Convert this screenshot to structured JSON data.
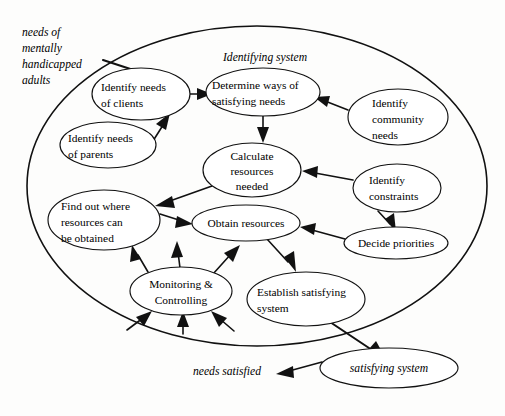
{
  "diagram": {
    "title": "Identifying system",
    "type": "influence-diagram",
    "boundary": {
      "label": "Identifying system",
      "label_x": 265,
      "label_y": 58,
      "cx": 257,
      "cy": 186,
      "rx": 230,
      "ry": 160
    },
    "external_inputs": [
      {
        "name": "needs-of-mentally-handicapped-adults",
        "lines": [
          "needs of",
          "mentally",
          "handicapped",
          "adults"
        ],
        "x": 22,
        "y": 34,
        "line_height": 16
      }
    ],
    "external_outputs": [
      {
        "name": "needs-satisfied",
        "label": "needs satisfied",
        "x": 193,
        "y": 373
      }
    ],
    "nodes": [
      {
        "id": "identify-needs-of-clients",
        "lines": [
          "Identify needs",
          "of clients"
        ],
        "cx": 141,
        "cy": 94,
        "rx": 49,
        "ry": 26,
        "align": "left",
        "text_x": 101
      },
      {
        "id": "determine-ways-of-satisfying-needs",
        "lines": [
          "Determine ways of",
          "satisfying needs"
        ],
        "cx": 263,
        "cy": 92,
        "rx": 57,
        "ry": 24,
        "align": "left",
        "text_x": 213
      },
      {
        "id": "identify-community-needs",
        "lines": [
          "Identify",
          "community",
          "needs"
        ],
        "cx": 398,
        "cy": 117,
        "rx": 50,
        "ry": 28,
        "align": "left",
        "text_x": 373
      },
      {
        "id": "identify-needs-of-parents",
        "lines": [
          "Identify needs",
          "of parents"
        ],
        "cx": 108,
        "cy": 145,
        "rx": 48,
        "ry": 23,
        "align": "left",
        "text_x": 68
      },
      {
        "id": "calculate-resources-needed",
        "lines": [
          "Calculate",
          "resources",
          "needed"
        ],
        "cx": 252,
        "cy": 170,
        "rx": 49,
        "ry": 27,
        "align": "center",
        "text_x": 252
      },
      {
        "id": "identify-constraints",
        "lines": [
          "Identify",
          "constraints"
        ],
        "cx": 397,
        "cy": 188,
        "rx": 44,
        "ry": 24,
        "align": "left",
        "text_x": 369
      },
      {
        "id": "find-out-where-resources-can-be-obtained",
        "lines": [
          "Find out where",
          "resources can",
          "be obtained"
        ],
        "cx": 104,
        "cy": 220,
        "rx": 56,
        "ry": 30,
        "align": "left",
        "text_x": 61
      },
      {
        "id": "obtain-resources",
        "lines": [
          "Obtain resources"
        ],
        "cx": 246,
        "cy": 223,
        "rx": 54,
        "ry": 18,
        "align": "center",
        "text_x": 246
      },
      {
        "id": "decide-priorities",
        "lines": [
          "Decide priorities"
        ],
        "cx": 396,
        "cy": 243,
        "rx": 52,
        "ry": 16,
        "align": "center",
        "text_x": 396
      },
      {
        "id": "monitoring-and-controlling",
        "lines": [
          "Monitoring &",
          "Controlling"
        ],
        "cx": 181,
        "cy": 291,
        "rx": 51,
        "ry": 24,
        "align": "center",
        "text_x": 181
      },
      {
        "id": "establish-satisfying-system",
        "lines": [
          "Establish satisfying",
          "system"
        ],
        "cx": 306,
        "cy": 299,
        "rx": 59,
        "ry": 27,
        "align": "left",
        "text_x": 257
      },
      {
        "id": "satisfying-system",
        "lines": [
          "satisfying system"
        ],
        "cx": 389,
        "cy": 368,
        "rx": 69,
        "ry": 20,
        "align": "center",
        "italic": true,
        "text_x": 389
      }
    ],
    "edges": [
      {
        "from": "needs-of-mentally-handicapped-adults",
        "to": "identifying-system-boundary"
      },
      {
        "from": "identify-needs-of-clients",
        "to": "determine-ways-of-satisfying-needs"
      },
      {
        "from": "identify-needs-of-parents",
        "to": "identify-needs-of-clients"
      },
      {
        "from": "identify-community-needs",
        "to": "determine-ways-of-satisfying-needs"
      },
      {
        "from": "determine-ways-of-satisfying-needs",
        "to": "calculate-resources-needed"
      },
      {
        "from": "identify-constraints",
        "to": "calculate-resources-needed"
      },
      {
        "from": "identify-constraints",
        "to": "decide-priorities"
      },
      {
        "from": "calculate-resources-needed",
        "to": "find-out-where-resources-can-be-obtained"
      },
      {
        "from": "find-out-where-resources-can-be-obtained",
        "to": "obtain-resources"
      },
      {
        "from": "decide-priorities",
        "to": "obtain-resources"
      },
      {
        "from": "obtain-resources",
        "to": "establish-satisfying-system"
      },
      {
        "from": "monitoring-and-controlling",
        "to": "find-out-where-resources-can-be-obtained"
      },
      {
        "from": "monitoring-and-controlling",
        "to": "obtain-resources"
      },
      {
        "from": "monitoring-and-controlling",
        "to": "calculate-resources-needed"
      },
      {
        "from": "feedback",
        "to": "monitoring-and-controlling"
      },
      {
        "from": "establish-satisfying-system",
        "to": "satisfying-system"
      },
      {
        "from": "satisfying-system",
        "to": "needs-satisfied"
      }
    ]
  }
}
